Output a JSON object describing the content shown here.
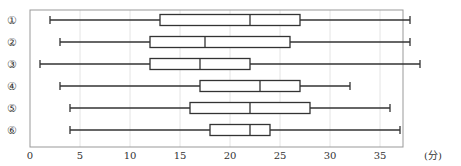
{
  "chart_data": {
    "type": "boxplot",
    "title": "",
    "xlabel": "(分)",
    "ylabel": "",
    "xlim": [
      0,
      37.3
    ],
    "xticks": [
      0,
      5,
      10,
      15,
      20,
      25,
      30,
      35
    ],
    "grid": "vertical",
    "categories": [
      "①",
      "②",
      "③",
      "④",
      "⑤",
      "⑥"
    ],
    "series": [
      {
        "name": "①",
        "min": 2,
        "q1": 13,
        "median": 22,
        "q3": 27,
        "max": 38
      },
      {
        "name": "②",
        "min": 3,
        "q1": 12,
        "median": 17.5,
        "q3": 26,
        "max": 38
      },
      {
        "name": "③",
        "min": 1,
        "q1": 12,
        "median": 17,
        "q3": 22,
        "max": 39
      },
      {
        "name": "④",
        "min": 3,
        "q1": 17,
        "median": 23,
        "q3": 27,
        "max": 32
      },
      {
        "name": "⑤",
        "min": 4,
        "q1": 16,
        "median": 22,
        "q3": 28,
        "max": 36
      },
      {
        "name": "⑥",
        "min": 4,
        "q1": 18,
        "median": 22,
        "q3": 24,
        "max": 37
      }
    ],
    "colors": {
      "line": "#333333",
      "frame": "#999999",
      "grid": "#e4e4e4",
      "box_fill": "#ffffff"
    }
  }
}
